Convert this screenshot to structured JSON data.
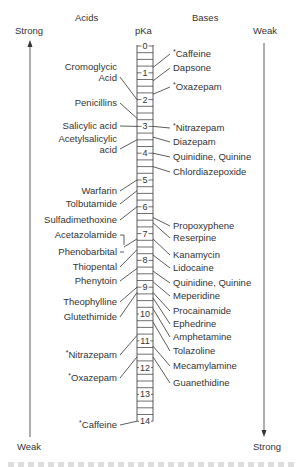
{
  "header": {
    "acids_label": "Acids",
    "bases_label": "Bases",
    "pka_label": "pKa",
    "left_top": "Strong",
    "left_bottom": "Weak",
    "right_top": "Weak",
    "right_bottom": "Strong"
  },
  "scale": {
    "min": 0,
    "max": 14,
    "ticks": [
      "0",
      "1",
      "2",
      "3",
      "4",
      "5",
      "6",
      "7",
      "8",
      "9",
      "10",
      "11",
      "12",
      "13",
      "14"
    ]
  },
  "acids": [
    {
      "name": "Cromoglycic",
      "name2": "Acid",
      "pka": 2.0,
      "star": false
    },
    {
      "name": "Penicillins",
      "pka": 2.7,
      "star": false
    },
    {
      "name": "Salicylic acid",
      "pka": 3.0,
      "star": false
    },
    {
      "name": "Acetylsalicylic",
      "name2": "acid",
      "pka": 3.5,
      "star": false
    },
    {
      "name": "Warfarin",
      "pka": 5.0,
      "star": false
    },
    {
      "name": "Tolbutamide",
      "pka": 5.4,
      "star": false
    },
    {
      "name": "Sulfadimethoxine",
      "pka": 6.0,
      "star": false
    },
    {
      "name": "Acetazolamide",
      "pka": 7.2,
      "star": false
    },
    {
      "name": "Phenobarbital",
      "pka": 7.2,
      "star": false
    },
    {
      "name": "Thiopental",
      "pka": 7.6,
      "star": false
    },
    {
      "name": "Phenytoin",
      "pka": 8.3,
      "star": false
    },
    {
      "name": "Theophylline",
      "pka": 9.0,
      "star": false
    },
    {
      "name": "Glutethimide",
      "pka": 9.2,
      "star": false
    },
    {
      "name": "Nitrazepam",
      "pka": 10.8,
      "star": true
    },
    {
      "name": "Oxazepam",
      "pka": 11.6,
      "star": true
    },
    {
      "name": "Caffeine",
      "pka": 14.0,
      "star": true
    }
  ],
  "bases": [
    {
      "name": "Caffeine",
      "pka": 0.8,
      "star": true
    },
    {
      "name": "Dapsone",
      "pka": 1.3,
      "star": false
    },
    {
      "name": "Oxazepam",
      "pka": 1.8,
      "star": true
    },
    {
      "name": "Nitrazepam",
      "pka": 3.0,
      "star": true
    },
    {
      "name": "Diazepam",
      "pka": 3.4,
      "star": false
    },
    {
      "name": "Quinidine, Quinine",
      "pka": 4.0,
      "star": false
    },
    {
      "name": "Chlordiazepoxide",
      "pka": 4.5,
      "star": false
    },
    {
      "name": "Propoxyphene",
      "pka": 6.4,
      "star": false
    },
    {
      "name": "Reserpine",
      "pka": 6.6,
      "star": false
    },
    {
      "name": "Kanamycin",
      "pka": 7.2,
      "star": false
    },
    {
      "name": "Lidocaine",
      "pka": 7.8,
      "star": false
    },
    {
      "name": "Quinidine, Quinine",
      "pka": 8.4,
      "star": false
    },
    {
      "name": "Meperidine",
      "pka": 8.8,
      "star": false
    },
    {
      "name": "Procainamide",
      "pka": 9.2,
      "star": false
    },
    {
      "name": "Ephedrine",
      "pka": 9.4,
      "star": false
    },
    {
      "name": "Amphetamine",
      "pka": 9.8,
      "star": false
    },
    {
      "name": "Tolazoline",
      "pka": 10.3,
      "star": false
    },
    {
      "name": "Mecamylamine",
      "pka": 11.2,
      "star": false
    },
    {
      "name": "Guanethidine",
      "pka": 11.6,
      "star": false
    }
  ],
  "colors": {
    "ink": "#333333",
    "background": "#ffffff"
  }
}
